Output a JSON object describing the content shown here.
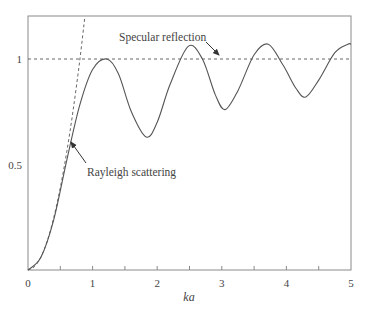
{
  "chart_data": {
    "type": "line",
    "title": "",
    "xlabel": "ka",
    "ylabel": "",
    "xlim": [
      0,
      5
    ],
    "ylim": [
      0,
      1.2
    ],
    "grid": false,
    "xticks": [
      0,
      0.5,
      1,
      1.5,
      2,
      2.5,
      3,
      3.5,
      4,
      4.5,
      5
    ],
    "xtick_labels": [
      "0",
      "1",
      "2",
      "3",
      "4",
      "5"
    ],
    "ytick_labels": [
      "0.5",
      "1"
    ],
    "series": [
      {
        "name": "Scattering cross-section (exact)",
        "style": "solid",
        "x": [
          0,
          0.2,
          0.4,
          0.6,
          0.8,
          1.0,
          1.22,
          1.4,
          1.6,
          1.83,
          2.0,
          2.2,
          2.48,
          2.7,
          2.9,
          3.05,
          3.25,
          3.5,
          3.72,
          3.95,
          4.15,
          4.3,
          4.5,
          4.75,
          4.95,
          5.0
        ],
        "values": [
          0,
          0.06,
          0.24,
          0.52,
          0.78,
          0.95,
          1.0,
          0.93,
          0.75,
          0.63,
          0.7,
          0.88,
          1.06,
          1.0,
          0.83,
          0.76,
          0.85,
          1.02,
          1.07,
          0.97,
          0.86,
          0.82,
          0.9,
          1.03,
          1.07,
          1.07
        ]
      },
      {
        "name": "Rayleigh scattering",
        "style": "dashed",
        "x": [
          0,
          0.1,
          0.2,
          0.3,
          0.4,
          0.5,
          0.6,
          0.7,
          0.8,
          0.88
        ],
        "values": [
          0,
          0.016,
          0.062,
          0.14,
          0.25,
          0.39,
          0.56,
          0.76,
          0.99,
          1.2
        ]
      },
      {
        "name": "Specular reflection",
        "style": "dashed",
        "x": [
          0,
          5
        ],
        "values": [
          1,
          1
        ]
      }
    ],
    "annotations": [
      {
        "text": "Specular reflection",
        "arrow_to": [
          2.9,
          1.0
        ]
      },
      {
        "text": "Rayleigh scattering",
        "arrow_to": [
          0.65,
          0.61
        ]
      }
    ]
  },
  "labels": {
    "x_axis": "ka",
    "x_ticks": [
      "0",
      "1",
      "2",
      "3",
      "4",
      "5"
    ],
    "y_ticks": [
      "0.5",
      "1"
    ],
    "specular": "Specular reflection",
    "rayleigh": "Rayleigh scattering"
  },
  "colors": {
    "frame": "#8a8a8a",
    "curve": "#555555",
    "dashed": "#666666",
    "text": "#444444"
  }
}
